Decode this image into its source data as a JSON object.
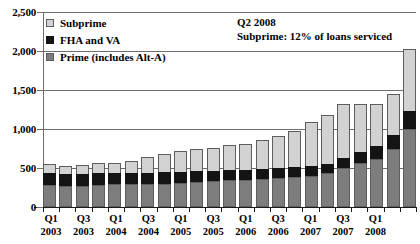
{
  "chart_data": {
    "type": "bar",
    "title": "",
    "subtitle": "",
    "xlabel": "",
    "ylabel": "",
    "ylim": [
      0,
      2500
    ],
    "ytick_labels": [
      "0",
      "500",
      "1,000",
      "1,500",
      "2,000",
      "2,500"
    ],
    "ytick_values": [
      0,
      500,
      1000,
      1500,
      2000,
      2500
    ],
    "grid": true,
    "stacked": true,
    "legend_position": "top-left",
    "categories": [
      "Q1 2003",
      "Q2 2003",
      "Q3 2003",
      "Q4 2003",
      "Q1 2004",
      "Q2 2004",
      "Q3 2004",
      "Q4 2004",
      "Q1 2005",
      "Q2 2005",
      "Q3 2005",
      "Q4 2005",
      "Q1 2006",
      "Q2 2006",
      "Q3 2006",
      "Q4 2006",
      "Q1 2007",
      "Q2 2007",
      "Q3 2007",
      "Q4 2007",
      "Q1 2008",
      "Q2 2008",
      "Q3 2008"
    ],
    "xtick_labels": [
      {
        "index": 0,
        "line1": "Q1",
        "line2": "2003"
      },
      {
        "index": 2,
        "line1": "Q3",
        "line2": "2003"
      },
      {
        "index": 4,
        "line1": "Q1",
        "line2": "2004"
      },
      {
        "index": 6,
        "line1": "Q3",
        "line2": "2004"
      },
      {
        "index": 8,
        "line1": "Q1",
        "line2": "2005"
      },
      {
        "index": 10,
        "line1": "Q3",
        "line2": "2005"
      },
      {
        "index": 12,
        "line1": "Q1",
        "line2": "2006"
      },
      {
        "index": 14,
        "line1": "Q3",
        "line2": "2006"
      },
      {
        "index": 16,
        "line1": "Q1",
        "line2": "2007"
      },
      {
        "index": 18,
        "line1": "Q3",
        "line2": "2007"
      },
      {
        "index": 20,
        "line1": "Q1",
        "line2": "2008"
      }
    ],
    "series": [
      {
        "name": "Prime (includes Alt-A)",
        "color": "#7d7d7d",
        "values": [
          280,
          270,
          270,
          280,
          290,
          290,
          290,
          300,
          310,
          320,
          330,
          340,
          350,
          360,
          370,
          380,
          400,
          430,
          500,
          570,
          620,
          740,
          1000
        ]
      },
      {
        "name": "FHA and VA",
        "color": "#141414",
        "values": [
          175,
          170,
          165,
          170,
          165,
          160,
          160,
          160,
          155,
          150,
          150,
          145,
          140,
          140,
          140,
          140,
          140,
          140,
          145,
          150,
          170,
          200,
          240
        ]
      },
      {
        "name": "Subprime",
        "color": "#d2d2d2",
        "values": [
          125,
          110,
          125,
          140,
          130,
          170,
          215,
          250,
          275,
          305,
          300,
          330,
          345,
          380,
          430,
          480,
          570,
          630,
          700,
          630,
          560,
          540,
          810
        ]
      }
    ],
    "totals": [
      580,
      550,
      560,
      590,
      585,
      620,
      665,
      710,
      740,
      775,
      780,
      815,
      835,
      880,
      940,
      1000,
      1110,
      1200,
      1345,
      1350,
      1350,
      1480,
      2050
    ]
  },
  "legend": {
    "items": [
      {
        "label": "Subprime",
        "swatch": "subprime"
      },
      {
        "label": "FHA and VA",
        "swatch": "fha"
      },
      {
        "label": "Prime (includes Alt-A)",
        "swatch": "prime"
      }
    ]
  },
  "annotation": {
    "line1": "Q2 2008",
    "line2": "Subprime: 12% of loans serviced"
  }
}
